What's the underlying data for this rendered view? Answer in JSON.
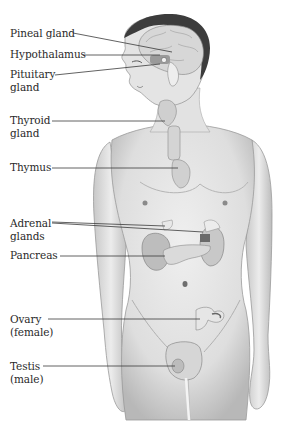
{
  "diagram": {
    "labels": [
      {
        "id": "pineal-gland",
        "lines": [
          "Pineal gland"
        ],
        "x": 10,
        "y": 27
      },
      {
        "id": "hypothalamus",
        "lines": [
          "Hypothalamus"
        ],
        "x": 10,
        "y": 48
      },
      {
        "id": "pituitary-gland",
        "lines": [
          "Pituitary",
          "gland"
        ],
        "x": 10,
        "y": 68
      },
      {
        "id": "thyroid-gland",
        "lines": [
          "Thyroid",
          "gland"
        ],
        "x": 10,
        "y": 114
      },
      {
        "id": "thymus",
        "lines": [
          "Thymus"
        ],
        "x": 10,
        "y": 161
      },
      {
        "id": "adrenal-glands",
        "lines": [
          "Adrenal",
          "glands"
        ],
        "x": 10,
        "y": 217
      },
      {
        "id": "pancreas",
        "lines": [
          "Pancreas"
        ],
        "x": 10,
        "y": 249
      },
      {
        "id": "ovary",
        "lines": [
          "Ovary",
          "(female)"
        ],
        "x": 10,
        "y": 313
      },
      {
        "id": "testis",
        "lines": [
          "Testis",
          "(male)"
        ],
        "x": 10,
        "y": 360
      }
    ],
    "leader_lines": [
      {
        "for": "pineal-gland",
        "x1": 73,
        "y1": 33,
        "x2": 172,
        "y2": 52
      },
      {
        "for": "hypothalamus",
        "x1": 83,
        "y1": 55,
        "x2": 160,
        "y2": 55
      },
      {
        "for": "pituitary-gland",
        "x1": 55,
        "y1": 75,
        "x2": 160,
        "y2": 64
      },
      {
        "for": "thyroid-gland",
        "x1": 52,
        "y1": 121,
        "x2": 165,
        "y2": 121
      },
      {
        "for": "thymus",
        "x1": 52,
        "y1": 168,
        "x2": 178,
        "y2": 168
      },
      {
        "for": "adrenal-glands-a",
        "x1": 52,
        "y1": 222,
        "x2": 165,
        "y2": 226
      },
      {
        "for": "adrenal-glands-b",
        "x1": 52,
        "y1": 223,
        "x2": 203,
        "y2": 232
      },
      {
        "for": "pancreas",
        "x1": 60,
        "y1": 256,
        "x2": 165,
        "y2": 256
      },
      {
        "for": "ovary",
        "x1": 48,
        "y1": 319,
        "x2": 200,
        "y2": 319
      },
      {
        "for": "testis",
        "x1": 43,
        "y1": 366,
        "x2": 175,
        "y2": 366
      }
    ],
    "colors": {
      "text": "#2a2a2a",
      "line": "#3a3a3a",
      "skin": "#e6e6e6",
      "skin_shadow": "#bdbdbd",
      "hair": "#3c3c3c",
      "brain": "#dcdcdc",
      "organ": "#cfcfcf"
    }
  }
}
